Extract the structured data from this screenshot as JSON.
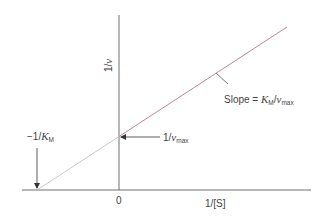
{
  "axes": {
    "x_label": "1/[S]",
    "y_label_prefix": "1/",
    "y_label_var": "v",
    "origin_label": "0"
  },
  "annotations": {
    "x_intercept": {
      "prefix": "−1/",
      "var": "K",
      "sub": "M"
    },
    "y_intercept": {
      "prefix": "1/",
      "var": "v",
      "sub": "max"
    },
    "slope": {
      "prefix": "Slope = ",
      "var1": "K",
      "sub1": "M",
      "sep": "/",
      "var2": "v",
      "sub2": "max"
    }
  },
  "colors": {
    "axis": "#6e6e6e",
    "line_measured": "#b98a90",
    "line_extrapolated": "#c9c9c9",
    "text": "#444444"
  }
}
